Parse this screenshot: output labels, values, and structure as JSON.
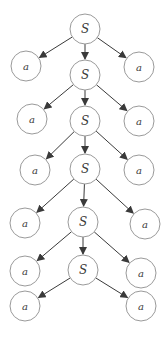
{
  "diagram": {
    "type": "parse-tree",
    "colors": {
      "stroke": "#9a9a9a",
      "edge": "#3a3a3a",
      "text": "#3a3a3a",
      "background": "#ffffff"
    },
    "node_radius": 15,
    "nodes": [
      {
        "id": "S0",
        "label": "S",
        "x": 85,
        "y": 29
      },
      {
        "id": "a1L",
        "label": "a",
        "x": 26,
        "y": 66
      },
      {
        "id": "S1",
        "label": "S",
        "x": 85,
        "y": 75
      },
      {
        "id": "a1R",
        "label": "a",
        "x": 139,
        "y": 67
      },
      {
        "id": "a2L",
        "label": "a",
        "x": 32,
        "y": 119
      },
      {
        "id": "S2",
        "label": "S",
        "x": 85,
        "y": 121
      },
      {
        "id": "a2R",
        "label": "a",
        "x": 139,
        "y": 121
      },
      {
        "id": "a3L",
        "label": "a",
        "x": 35,
        "y": 170
      },
      {
        "id": "S3",
        "label": "S",
        "x": 85,
        "y": 169
      },
      {
        "id": "a3R",
        "label": "a",
        "x": 139,
        "y": 170
      },
      {
        "id": "a4L",
        "label": "a",
        "x": 25,
        "y": 223
      },
      {
        "id": "S4",
        "label": "S",
        "x": 83,
        "y": 222
      },
      {
        "id": "a4R",
        "label": "a",
        "x": 145,
        "y": 224
      },
      {
        "id": "a5L",
        "label": "a",
        "x": 25,
        "y": 271
      },
      {
        "id": "S5",
        "label": "S",
        "x": 83,
        "y": 270
      },
      {
        "id": "a5R",
        "label": "a",
        "x": 141,
        "y": 273
      },
      {
        "id": "a6L",
        "label": "a",
        "x": 25,
        "y": 306
      },
      {
        "id": "a6R",
        "label": "a",
        "x": 141,
        "y": 306
      }
    ],
    "edges": [
      [
        "S0",
        "a1L"
      ],
      [
        "S0",
        "S1"
      ],
      [
        "S0",
        "a1R"
      ],
      [
        "S1",
        "a2L"
      ],
      [
        "S1",
        "S2"
      ],
      [
        "S1",
        "a2R"
      ],
      [
        "S2",
        "a3L"
      ],
      [
        "S2",
        "S3"
      ],
      [
        "S2",
        "a3R"
      ],
      [
        "S3",
        "a4L"
      ],
      [
        "S3",
        "S4"
      ],
      [
        "S3",
        "a4R"
      ],
      [
        "S4",
        "a5L"
      ],
      [
        "S4",
        "S5"
      ],
      [
        "S4",
        "a5R"
      ],
      [
        "S5",
        "a6L"
      ],
      [
        "S5",
        "a6R"
      ]
    ]
  }
}
